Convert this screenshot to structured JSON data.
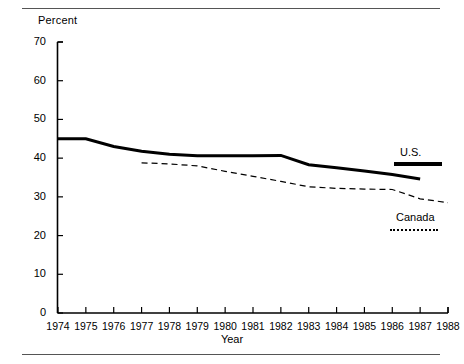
{
  "figure": {
    "unit_label": "Percent",
    "x_axis_title": "Year",
    "top_rule": "horizontal-rule",
    "bottom_rule": "horizontal-rule"
  },
  "legend": {
    "series": [
      {
        "label": "U.S.",
        "style": "solid-thick"
      },
      {
        "label": "Canada",
        "style": "dotted"
      }
    ]
  },
  "chart_data": {
    "type": "line",
    "title": "",
    "subtitle": "",
    "xlabel": "Year",
    "ylabel": "Percent",
    "xlim": [
      1974,
      1988
    ],
    "ylim": [
      0,
      70
    ],
    "yticks": [
      0,
      10,
      20,
      30,
      40,
      50,
      60,
      70
    ],
    "xticks": [
      1974,
      1975,
      1976,
      1977,
      1978,
      1979,
      1980,
      1981,
      1982,
      1983,
      1984,
      1985,
      1986,
      1987,
      1988
    ],
    "grid": false,
    "legend_position": "right-inside",
    "x": [
      1974,
      1975,
      1976,
      1977,
      1978,
      1979,
      1980,
      1981,
      1982,
      1983,
      1984,
      1985,
      1986,
      1987,
      1988
    ],
    "series": [
      {
        "name": "U.S.",
        "style": "solid",
        "linewidth": 3,
        "color": "#000000",
        "x": [
          1974,
          1975,
          1976,
          1977,
          1978,
          1979,
          1980,
          1981,
          1982,
          1983,
          1984,
          1985,
          1986,
          1987
        ],
        "values": [
          45.0,
          45.0,
          43.0,
          41.8,
          41.0,
          40.6,
          40.6,
          40.6,
          40.7,
          38.3,
          37.5,
          36.7,
          35.8,
          34.6
        ]
      },
      {
        "name": "Canada",
        "style": "dashed",
        "linewidth": 1.2,
        "color": "#000000",
        "x": [
          1977,
          1978,
          1979,
          1980,
          1981,
          1982,
          1983,
          1984,
          1985,
          1986,
          1987,
          1988
        ],
        "values": [
          38.8,
          38.5,
          38.0,
          36.6,
          35.3,
          34.0,
          32.6,
          32.2,
          32.0,
          31.9,
          29.5,
          28.5
        ]
      }
    ]
  }
}
